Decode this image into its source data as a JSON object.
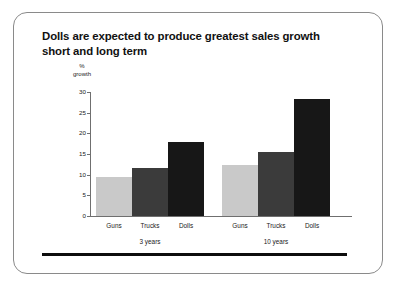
{
  "slide": {
    "title": "Dolls are expected to produce greatest sales growth short and long term"
  },
  "colors": {
    "guns": "#c9c9c9",
    "trucks": "#3b3b3b",
    "dolls": "#171717",
    "axis": "#6f6f6f",
    "text": "#1a1a1a",
    "frame": "#8a8a8a",
    "rule": "#0d0d0d"
  },
  "chart_data": {
    "type": "bar",
    "title": "Dolls are expected to produce greatest sales growth short and long term",
    "xlabel": "",
    "ylabel": "% growth",
    "ylabel_lines": [
      "%",
      "growth"
    ],
    "ylim": [
      0,
      30
    ],
    "yticks": [
      0,
      5,
      10,
      15,
      20,
      25,
      30
    ],
    "ytick_labels": [
      "0",
      "5",
      "10",
      "15",
      "20",
      "25",
      "30"
    ],
    "grid": false,
    "legend": "none",
    "categories": [
      "Guns",
      "Trucks",
      "Dolls"
    ],
    "groups": [
      "3 years",
      "10 years"
    ],
    "series": [
      {
        "name": "3 years",
        "values": [
          9.4,
          11.5,
          17.8
        ]
      },
      {
        "name": "10 years",
        "values": [
          12.4,
          15.5,
          28.3
        ]
      }
    ],
    "bars": [
      {
        "group": "3 years",
        "category": "Guns",
        "value": 9.4,
        "color": "#c9c9c9"
      },
      {
        "group": "3 years",
        "category": "Trucks",
        "value": 11.5,
        "color": "#3b3b3b"
      },
      {
        "group": "3 years",
        "category": "Dolls",
        "value": 17.8,
        "color": "#171717"
      },
      {
        "group": "10 years",
        "category": "Guns",
        "value": 12.4,
        "color": "#c9c9c9"
      },
      {
        "group": "10 years",
        "category": "Trucks",
        "value": 15.5,
        "color": "#3b3b3b"
      },
      {
        "group": "10 years",
        "category": "Dolls",
        "value": 28.3,
        "color": "#171717"
      }
    ]
  }
}
